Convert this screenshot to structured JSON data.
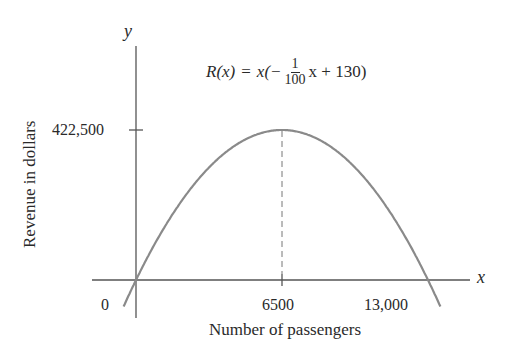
{
  "chart_data": {
    "type": "line",
    "title": "",
    "function_label": {
      "lhs": "R(x)",
      "eq": "=",
      "pre": "x(−",
      "frac_num": "1",
      "frac_den": "100",
      "post": "x + 130)"
    },
    "xlabel": "Number of passengers",
    "ylabel": "Revenue in dollars",
    "x_axis_symbol": "x",
    "y_axis_symbol": "y",
    "x_ticks": [
      {
        "value": 0,
        "label": "0"
      },
      {
        "value": 6500,
        "label": "6500"
      },
      {
        "value": 13000,
        "label": "13,000"
      }
    ],
    "y_ticks": [
      {
        "value": 422500,
        "label": "422,500"
      }
    ],
    "series": [
      {
        "name": "R(x) = x(-x/100 + 130)",
        "x": [
          -500,
          0,
          1000,
          2000,
          3000,
          4000,
          5000,
          6000,
          6500,
          7000,
          8000,
          9000,
          10000,
          11000,
          12000,
          13000,
          13500
        ],
        "y": [
          -67500,
          0,
          120000,
          220000,
          300000,
          360000,
          400000,
          420000,
          422500,
          420000,
          400000,
          360000,
          300000,
          220000,
          120000,
          0,
          -67500
        ]
      }
    ],
    "vertex": {
      "x": 6500,
      "y": 422500
    },
    "annotations": [
      "dashed vertical line from vertex (6500, 422500) to x-axis"
    ],
    "grid": false,
    "legend": "none",
    "colors": {
      "curve": "#8a8a8a",
      "axes": "#555555",
      "text": "#2a2a2a"
    }
  }
}
